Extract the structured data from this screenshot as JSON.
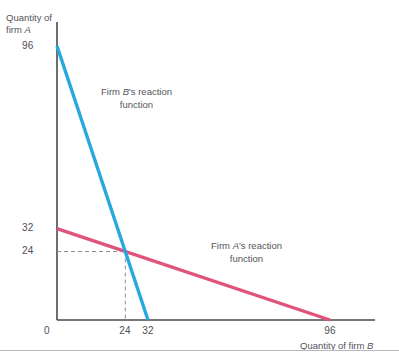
{
  "figure": {
    "background_color": "#ffffff",
    "footer_rule_color": "#b9b9bd"
  },
  "axes": {
    "y_axis_title_line1": "Quantity of",
    "y_axis_title_line2_prefix": "firm ",
    "y_axis_title_line2_italic": "A",
    "x_axis_title_prefix": "Quantity of firm ",
    "x_axis_title_italic": "B",
    "axis_color": "#4a4a4a",
    "origin_label": "0",
    "y_ticks": [
      "96",
      "32",
      "24"
    ],
    "x_ticks": [
      "24",
      "32",
      "96"
    ]
  },
  "annotations": {
    "firm_b_label_line1_prefix": "Firm ",
    "firm_b_label_line1_italic": "B",
    "firm_b_label_line1_suffix": "'s reaction",
    "firm_b_label_line2": "function",
    "firm_a_label_line1_prefix": "Firm ",
    "firm_a_label_line1_italic": "A",
    "firm_a_label_line1_suffix": "'s reaction",
    "firm_a_label_line2": "function"
  },
  "chart_data": {
    "type": "line",
    "title": "",
    "xlabel": "Quantity of firm B",
    "ylabel": "Quantity of firm A",
    "xlim": [
      0,
      112
    ],
    "ylim": [
      0,
      105
    ],
    "grid": false,
    "legend": "inline-annotations",
    "xticks": [
      0,
      24,
      32,
      96
    ],
    "yticks": [
      0,
      24,
      32,
      96
    ],
    "series": [
      {
        "name": "Firm B's reaction function",
        "color": "#29a8e0",
        "width": 3.4,
        "points": [
          [
            0,
            96
          ],
          [
            32,
            0
          ]
        ]
      },
      {
        "name": "Firm A's reaction function",
        "color": "#e0537a",
        "width": 3.4,
        "points": [
          [
            0,
            32
          ],
          [
            96,
            0
          ]
        ]
      }
    ],
    "equilibrium": {
      "label": "Cournot-Nash equilibrium",
      "x": 24,
      "y": 24,
      "guide_style": "dashed",
      "guide_color": "#8e8e93"
    }
  }
}
